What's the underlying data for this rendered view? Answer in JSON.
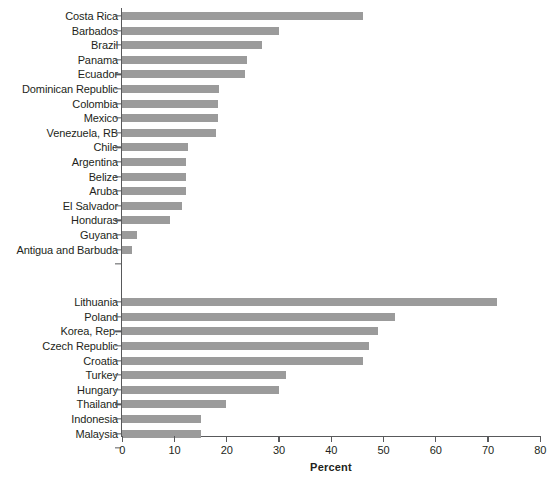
{
  "chart_data": {
    "type": "bar",
    "orientation": "horizontal",
    "title": "",
    "xlabel": "Percent",
    "ylabel": "",
    "xlim": [
      0,
      80
    ],
    "xticks": [
      0,
      10,
      20,
      30,
      40,
      50,
      60,
      70,
      80
    ],
    "xticklabels": [
      "0",
      "10",
      "20",
      "30",
      "40",
      "50",
      "60",
      "70",
      "80"
    ],
    "grid": false,
    "legend": false,
    "bar_color": "#9b9b9b",
    "axis_color": "#58595b",
    "groups": [
      {
        "name": "group-1",
        "categories": [
          "Costa Rica",
          "Barbados",
          "Brazil",
          "Panama",
          "Ecuador",
          "Dominican Republic",
          "Colombia",
          "Mexico",
          "Venezuela, RB",
          "Chile",
          "Argentina",
          "Belize",
          "Aruba",
          "El Salvador",
          "Honduras",
          "Guyana",
          "Antigua and Barbuda"
        ],
        "values": [
          46.1,
          29.9,
          26.8,
          23.9,
          23.5,
          18.6,
          18.4,
          18.4,
          18.0,
          12.5,
          12.2,
          12.2,
          12.2,
          11.5,
          9.2,
          2.8,
          1.8
        ]
      },
      {
        "name": "group-2",
        "categories": [
          "Lithuania",
          "Poland",
          "Korea, Rep.",
          "Czech Republic",
          "Croatia",
          "Turkey",
          "Hungary",
          "Thailand",
          "Indonesia",
          "Malaysia"
        ],
        "values": [
          71.8,
          52.2,
          49.0,
          47.3,
          46.1,
          31.4,
          30.0,
          19.9,
          15.1,
          15.1
        ]
      }
    ]
  }
}
